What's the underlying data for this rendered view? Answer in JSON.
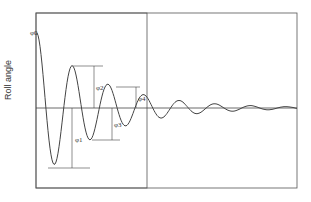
{
  "chart_data": {
    "type": "line",
    "title": "",
    "xlabel": "",
    "ylabel": "Roll angle",
    "annotations": [
      "φ0",
      "φ1",
      "φ2",
      "φ3",
      "φ4"
    ],
    "grid": false,
    "zero_line": true
  },
  "labels": {
    "ylabel": "Roll angle",
    "phi0": "φ0",
    "phi1": "φ1",
    "phi2": "φ2",
    "phi3": "φ3",
    "phi4": "φ4"
  },
  "colors": {
    "line": "#444444",
    "frame": "#555555"
  }
}
